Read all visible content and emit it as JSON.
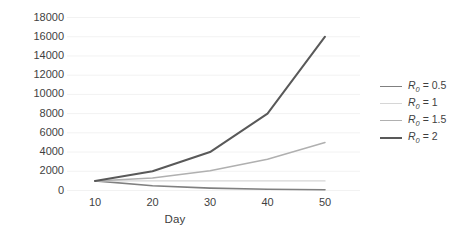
{
  "chart_data": {
    "type": "line",
    "title": "",
    "xlabel": "Day",
    "ylabel": "Infections",
    "x": [
      10,
      20,
      30,
      40,
      50
    ],
    "xlim": [
      10,
      50
    ],
    "ylim": [
      0,
      18000
    ],
    "xticks": [
      "10",
      "20",
      "30",
      "40",
      "50"
    ],
    "yticks": [
      "0",
      "2000",
      "4000",
      "6000",
      "8000",
      "10000",
      "12000",
      "14000",
      "16000",
      "18000"
    ],
    "grid": "horizontal",
    "legend_position": "right",
    "series": [
      {
        "name": "R0 = 0.5",
        "label_prefix": "R",
        "label_sub": "0",
        "label_value": " = 0.5",
        "color": "#808080",
        "width": 1.6,
        "values": [
          1000,
          500,
          250,
          130,
          80
        ]
      },
      {
        "name": "R0 = 1",
        "label_prefix": "R",
        "label_sub": "0",
        "label_value": " = 1",
        "color": "#d6d6d6",
        "width": 1.4,
        "values": [
          1000,
          1000,
          1000,
          1000,
          1000
        ]
      },
      {
        "name": "R0 = 1.5",
        "label_prefix": "R",
        "label_sub": "0",
        "label_value": " = 1.5",
        "color": "#b0b0b0",
        "width": 1.5,
        "values": [
          1000,
          1300,
          2050,
          3250,
          5000
        ]
      },
      {
        "name": "R0 = 2",
        "label_prefix": "R",
        "label_sub": "0",
        "label_value": " = 2",
        "color": "#595959",
        "width": 2.0,
        "values": [
          1000,
          2000,
          4000,
          8000,
          16000
        ]
      }
    ],
    "gridline_color": "#f2f2f2",
    "text_color": "#3f3f3f"
  }
}
